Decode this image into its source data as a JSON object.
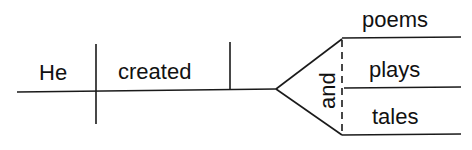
{
  "diagram": {
    "type": "sentence-diagram",
    "subject": "He",
    "verb": "created",
    "conjunction": "and",
    "compound_objects": [
      "poems",
      "plays",
      "tales"
    ],
    "colors": {
      "ink": "#1a1a1a",
      "background": "#ffffff"
    }
  }
}
